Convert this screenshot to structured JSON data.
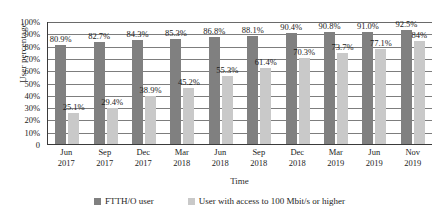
{
  "chart_data": {
    "type": "bar",
    "title": "",
    "xlabel": "Time",
    "ylabel": "User percentage",
    "ylim": [
      0,
      100
    ],
    "ytick_labels": [
      "100%",
      "90%",
      "80%",
      "70%",
      "60%",
      "50%",
      "40%",
      "30%",
      "20%",
      "10%",
      "0"
    ],
    "ytick_values": [
      100,
      90,
      80,
      70,
      60,
      50,
      40,
      30,
      20,
      10,
      0
    ],
    "grid": true,
    "legend_position": "bottom",
    "categories": [
      "Jun\n2017",
      "Sep\n2017",
      "Dec\n2017",
      "Mar\n2018",
      "Jun\n2018",
      "Sep\n2018",
      "Dec\n2018",
      "Mar\n2019",
      "Jun\n2019",
      "Nov\n2019"
    ],
    "category_lines": [
      [
        "Jun",
        "2017"
      ],
      [
        "Sep",
        "2017"
      ],
      [
        "Dec",
        "2017"
      ],
      [
        "Mar",
        "2018"
      ],
      [
        "Jun",
        "2018"
      ],
      [
        "Sep",
        "2018"
      ],
      [
        "Dec",
        "2018"
      ],
      [
        "Mar",
        "2019"
      ],
      [
        "Jun",
        "2019"
      ],
      [
        "Nov",
        "2019"
      ]
    ],
    "series": [
      {
        "name": "FTTH/O user",
        "color": "#808080",
        "values": [
          80.9,
          82.7,
          84.3,
          85.3,
          86.8,
          88.1,
          90.4,
          90.8,
          91.0,
          92.5
        ],
        "labels": [
          "80.9%",
          "82.7%",
          "84.3%",
          "85.3%",
          "86.8%",
          "88.1%",
          "90.4%",
          "90.8%",
          "91.0%",
          "92.5%"
        ]
      },
      {
        "name": "User with access to 100 Mbit/s or higher",
        "color": "#c9c9c9",
        "values": [
          25.1,
          29.4,
          38.9,
          45.2,
          55.3,
          61.4,
          70.3,
          73.7,
          77.1,
          84.0
        ],
        "labels": [
          "25.1%",
          "29.4%",
          "38.9%",
          "45.2%",
          "55.3%",
          "61.4%",
          "70.3%",
          "73.7%",
          "77.1%",
          "84%"
        ]
      }
    ]
  },
  "legend": {
    "items": [
      {
        "label": "FTTH/O user"
      },
      {
        "label": "User with access to 100 Mbit/s or higher"
      }
    ]
  }
}
